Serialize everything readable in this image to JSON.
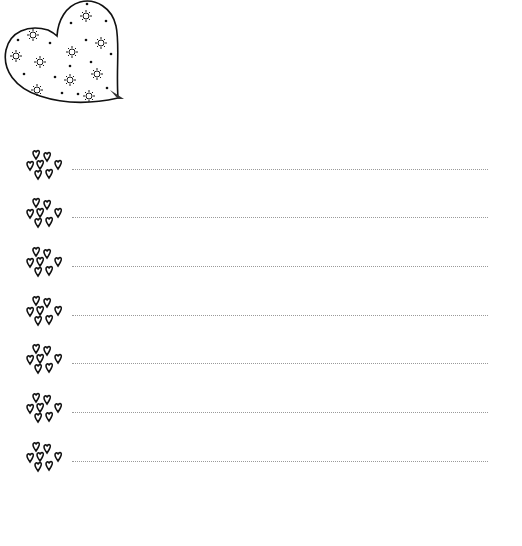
{
  "page": {
    "type": "lined-writing-sheet",
    "background": "#ffffff",
    "ink_color": "#111111",
    "line_color": "#9a9a9a"
  },
  "decoration": {
    "corner_icon": "heart-with-suns-and-dots-icon",
    "bullet_icon": "heart-cluster-icon"
  },
  "lines": [
    {
      "index": 1,
      "text": ""
    },
    {
      "index": 2,
      "text": ""
    },
    {
      "index": 3,
      "text": ""
    },
    {
      "index": 4,
      "text": ""
    },
    {
      "index": 5,
      "text": ""
    },
    {
      "index": 6,
      "text": ""
    },
    {
      "index": 7,
      "text": ""
    }
  ]
}
